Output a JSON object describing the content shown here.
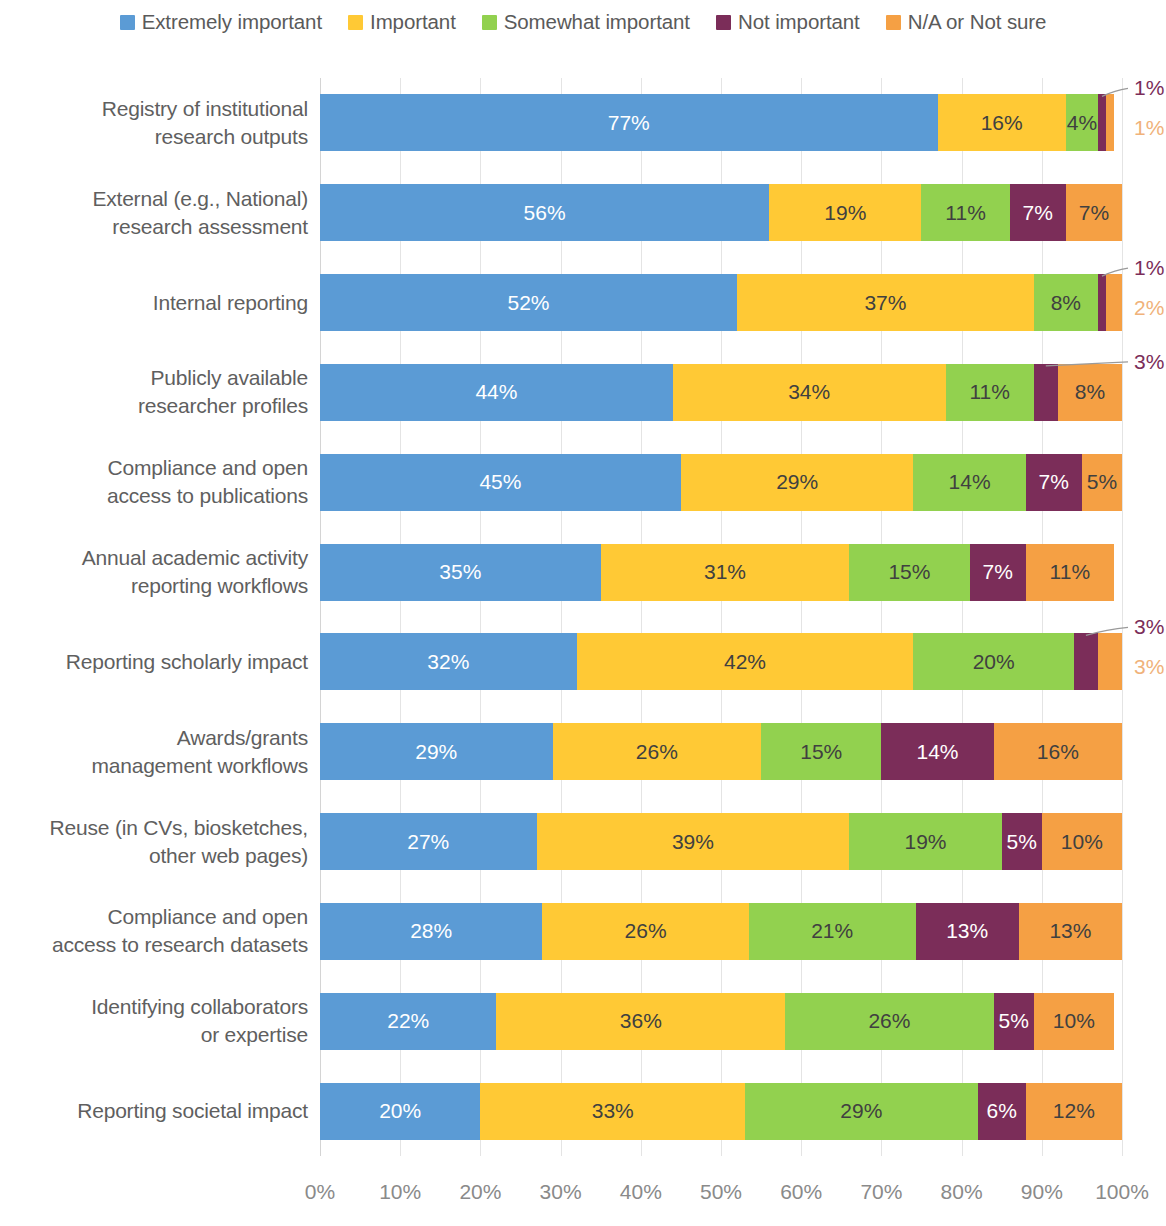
{
  "legend": {
    "items": [
      {
        "label": "Extremely important",
        "color": "#5B9BD5"
      },
      {
        "label": "Important",
        "color": "#FFC935"
      },
      {
        "label": "Somewhat important",
        "color": "#92D14F"
      },
      {
        "label": "Not important",
        "color": "#7B2D59"
      },
      {
        "label": "N/A or Not sure",
        "color": "#F5A044"
      }
    ]
  },
  "axis": {
    "ticks": [
      "0%",
      "10%",
      "20%",
      "30%",
      "40%",
      "50%",
      "60%",
      "70%",
      "80%",
      "90%",
      "100%"
    ]
  },
  "chart_data": {
    "type": "bar",
    "orientation": "horizontal",
    "stacked": true,
    "stack_mode": "percent",
    "title": "",
    "xlabel": "",
    "ylabel": "",
    "xlim": [
      0,
      100
    ],
    "grid": true,
    "legend_position": "top",
    "legend": [
      "Extremely important",
      "Important",
      "Somewhat important",
      "Not important",
      "N/A or Not sure"
    ],
    "colors": [
      "#5B9BD5",
      "#FFC935",
      "#92D14F",
      "#7B2D59",
      "#F5A044"
    ],
    "categories": [
      "Registry of institutional research outputs",
      "External (e.g., National) research assessment",
      "Internal reporting",
      "Publicly available researcher profiles",
      "Compliance and open access to publications",
      "Annual academic activity reporting workflows",
      "Reporting scholarly impact",
      "Awards/grants management workflows",
      "Reuse (in CVs, biosketches, other web pages)",
      "Compliance and open access to research datasets",
      "Identifying collaborators or expertise",
      "Reporting societal impact"
    ],
    "series": [
      {
        "name": "Extremely important",
        "values": [
          77,
          56,
          52,
          44,
          45,
          35,
          32,
          29,
          27,
          28,
          22,
          20
        ]
      },
      {
        "name": "Important",
        "values": [
          16,
          19,
          37,
          34,
          29,
          31,
          42,
          26,
          39,
          26,
          36,
          33
        ]
      },
      {
        "name": "Somewhat important",
        "values": [
          4,
          11,
          8,
          11,
          14,
          15,
          20,
          15,
          19,
          21,
          26,
          29
        ]
      },
      {
        "name": "Not important",
        "values": [
          1,
          7,
          1,
          3,
          7,
          7,
          3,
          14,
          5,
          13,
          5,
          6
        ]
      },
      {
        "name": "N/A or Not sure",
        "values": [
          1,
          7,
          2,
          8,
          5,
          11,
          3,
          16,
          10,
          13,
          10,
          12
        ]
      }
    ]
  },
  "rows": [
    {
      "label_lines": [
        "Registry of institutional",
        "research outputs"
      ],
      "segments": [
        {
          "value": 77,
          "text": "77%",
          "label_style": "light",
          "inline": true
        },
        {
          "value": 16,
          "text": "16%",
          "label_style": "dark",
          "inline": true
        },
        {
          "value": 4,
          "text": "4%",
          "label_style": "dark",
          "inline": true
        },
        {
          "value": 1,
          "text": "1%",
          "label_style": "dark",
          "inline": false
        },
        {
          "value": 1,
          "text": "1%",
          "label_style": "dark",
          "inline": false
        }
      ],
      "callouts": [
        {
          "text": "1%",
          "color": "#7B2D59",
          "leader": true
        },
        {
          "text": "1%",
          "color": "#F0B27A",
          "leader": false
        }
      ]
    },
    {
      "label_lines": [
        "External (e.g., National)",
        "research assessment"
      ],
      "segments": [
        {
          "value": 56,
          "text": "56%",
          "label_style": "light",
          "inline": true
        },
        {
          "value": 19,
          "text": "19%",
          "label_style": "dark",
          "inline": true
        },
        {
          "value": 11,
          "text": "11%",
          "label_style": "dark",
          "inline": true
        },
        {
          "value": 7,
          "text": "7%",
          "label_style": "light",
          "inline": true
        },
        {
          "value": 7,
          "text": "7%",
          "label_style": "dark",
          "inline": true
        }
      ],
      "callouts": []
    },
    {
      "label_lines": [
        "Internal reporting"
      ],
      "segments": [
        {
          "value": 52,
          "text": "52%",
          "label_style": "light",
          "inline": true
        },
        {
          "value": 37,
          "text": "37%",
          "label_style": "dark",
          "inline": true
        },
        {
          "value": 8,
          "text": "8%",
          "label_style": "dark",
          "inline": true
        },
        {
          "value": 1,
          "text": "1%",
          "label_style": "dark",
          "inline": false
        },
        {
          "value": 2,
          "text": "2%",
          "label_style": "dark",
          "inline": false
        }
      ],
      "callouts": [
        {
          "text": "1%",
          "color": "#7B2D59",
          "leader": true
        },
        {
          "text": "2%",
          "color": "#F0B27A",
          "leader": false
        }
      ]
    },
    {
      "label_lines": [
        "Publicly available",
        "researcher profiles"
      ],
      "segments": [
        {
          "value": 44,
          "text": "44%",
          "label_style": "light",
          "inline": true
        },
        {
          "value": 34,
          "text": "34%",
          "label_style": "dark",
          "inline": true
        },
        {
          "value": 11,
          "text": "11%",
          "label_style": "dark",
          "inline": true
        },
        {
          "value": 3,
          "text": "3%",
          "label_style": "dark",
          "inline": false
        },
        {
          "value": 8,
          "text": "8%",
          "label_style": "dark",
          "inline": true
        }
      ],
      "callouts": [
        {
          "text": "3%",
          "color": "#7B2D59",
          "leader": true
        }
      ]
    },
    {
      "label_lines": [
        "Compliance and open",
        "access to publications"
      ],
      "segments": [
        {
          "value": 45,
          "text": "45%",
          "label_style": "light",
          "inline": true
        },
        {
          "value": 29,
          "text": "29%",
          "label_style": "dark",
          "inline": true
        },
        {
          "value": 14,
          "text": "14%",
          "label_style": "dark",
          "inline": true
        },
        {
          "value": 7,
          "text": "7%",
          "label_style": "light",
          "inline": true
        },
        {
          "value": 5,
          "text": "5%",
          "label_style": "dark",
          "inline": true
        }
      ],
      "callouts": []
    },
    {
      "label_lines": [
        "Annual academic activity",
        "reporting workflows"
      ],
      "segments": [
        {
          "value": 35,
          "text": "35%",
          "label_style": "light",
          "inline": true
        },
        {
          "value": 31,
          "text": "31%",
          "label_style": "dark",
          "inline": true
        },
        {
          "value": 15,
          "text": "15%",
          "label_style": "dark",
          "inline": true
        },
        {
          "value": 7,
          "text": "7%",
          "label_style": "light",
          "inline": true
        },
        {
          "value": 11,
          "text": "11%",
          "label_style": "dark",
          "inline": true
        }
      ],
      "callouts": []
    },
    {
      "label_lines": [
        "Reporting scholarly impact"
      ],
      "segments": [
        {
          "value": 32,
          "text": "32%",
          "label_style": "light",
          "inline": true
        },
        {
          "value": 42,
          "text": "42%",
          "label_style": "dark",
          "inline": true
        },
        {
          "value": 20,
          "text": "20%",
          "label_style": "dark",
          "inline": true
        },
        {
          "value": 3,
          "text": "3%",
          "label_style": "dark",
          "inline": false
        },
        {
          "value": 3,
          "text": "3%",
          "label_style": "dark",
          "inline": false
        }
      ],
      "callouts": [
        {
          "text": "3%",
          "color": "#7B2D59",
          "leader": true
        },
        {
          "text": "3%",
          "color": "#F0B27A",
          "leader": false
        }
      ]
    },
    {
      "label_lines": [
        "Awards/grants",
        "management workflows"
      ],
      "segments": [
        {
          "value": 29,
          "text": "29%",
          "label_style": "light",
          "inline": true
        },
        {
          "value": 26,
          "text": "26%",
          "label_style": "dark",
          "inline": true
        },
        {
          "value": 15,
          "text": "15%",
          "label_style": "dark",
          "inline": true
        },
        {
          "value": 14,
          "text": "14%",
          "label_style": "light",
          "inline": true
        },
        {
          "value": 16,
          "text": "16%",
          "label_style": "dark",
          "inline": true
        }
      ],
      "callouts": []
    },
    {
      "label_lines": [
        "Reuse (in CVs, biosketches,",
        "other web pages)"
      ],
      "segments": [
        {
          "value": 27,
          "text": "27%",
          "label_style": "light",
          "inline": true
        },
        {
          "value": 39,
          "text": "39%",
          "label_style": "dark",
          "inline": true
        },
        {
          "value": 19,
          "text": "19%",
          "label_style": "dark",
          "inline": true
        },
        {
          "value": 5,
          "text": "5%",
          "label_style": "light",
          "inline": true
        },
        {
          "value": 10,
          "text": "10%",
          "label_style": "dark",
          "inline": true
        }
      ],
      "callouts": []
    },
    {
      "label_lines": [
        "Compliance and open",
        "access to research datasets"
      ],
      "segments": [
        {
          "value": 28,
          "text": "28%",
          "label_style": "light",
          "inline": true
        },
        {
          "value": 26,
          "text": "26%",
          "label_style": "dark",
          "inline": true
        },
        {
          "value": 21,
          "text": "21%",
          "label_style": "dark",
          "inline": true
        },
        {
          "value": 13,
          "text": "13%",
          "label_style": "light",
          "inline": true
        },
        {
          "value": 13,
          "text": "13%",
          "label_style": "dark",
          "inline": true
        }
      ],
      "callouts": []
    },
    {
      "label_lines": [
        "Identifying collaborators",
        "or expertise"
      ],
      "segments": [
        {
          "value": 22,
          "text": "22%",
          "label_style": "light",
          "inline": true
        },
        {
          "value": 36,
          "text": "36%",
          "label_style": "dark",
          "inline": true
        },
        {
          "value": 26,
          "text": "26%",
          "label_style": "dark",
          "inline": true
        },
        {
          "value": 5,
          "text": "5%",
          "label_style": "light",
          "inline": true
        },
        {
          "value": 10,
          "text": "10%",
          "label_style": "dark",
          "inline": true
        }
      ],
      "callouts": []
    },
    {
      "label_lines": [
        "Reporting societal impact"
      ],
      "segments": [
        {
          "value": 20,
          "text": "20%",
          "label_style": "light",
          "inline": true
        },
        {
          "value": 33,
          "text": "33%",
          "label_style": "dark",
          "inline": true
        },
        {
          "value": 29,
          "text": "29%",
          "label_style": "dark",
          "inline": true
        },
        {
          "value": 6,
          "text": "6%",
          "label_style": "light",
          "inline": true
        },
        {
          "value": 12,
          "text": "12%",
          "label_style": "dark",
          "inline": true
        }
      ],
      "callouts": []
    }
  ]
}
